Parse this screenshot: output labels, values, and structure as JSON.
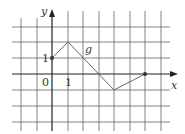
{
  "diagram": {
    "type": "piecewise-linear-function-graph",
    "axes": {
      "x_label": "x",
      "y_label": "y",
      "origin_label": "0",
      "x_tick_label": "1",
      "y_tick_label": "1"
    },
    "function_label": "g",
    "grid": {
      "x_min": -2,
      "x_max": 7,
      "y_min": -3,
      "y_max": 4,
      "unit_px": 15.6
    },
    "points": [
      {
        "x": 0,
        "y": 1,
        "marked": true
      },
      {
        "x": 1,
        "y": 2,
        "marked": false
      },
      {
        "x": 4,
        "y": -1,
        "marked": false
      },
      {
        "x": 6,
        "y": 0,
        "marked": true
      }
    ],
    "colors": {
      "grid": "#555555",
      "axes": "#222222",
      "curve": "#555555",
      "text": "#333333"
    }
  }
}
